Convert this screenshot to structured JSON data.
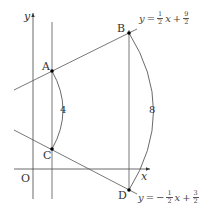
{
  "diagram": {
    "axes": {
      "x_label": "x",
      "y_label": "y",
      "origin_label": "O"
    },
    "points": [
      {
        "id": "A",
        "label": "A"
      },
      {
        "id": "B",
        "label": "B"
      },
      {
        "id": "C",
        "label": "C"
      },
      {
        "id": "D",
        "label": "D"
      }
    ],
    "segment_lengths": {
      "AC": "4",
      "BD": "8"
    },
    "lines": {
      "upper": {
        "lhs": "y",
        "eq": "=",
        "sign": "",
        "coef_num": "1",
        "coef_den": "2",
        "var": "x",
        "plus": "+",
        "const_num": "9",
        "const_den": "2"
      },
      "lower": {
        "lhs": "y",
        "eq": "=",
        "sign": "−",
        "coef_num": "1",
        "coef_den": "2",
        "var": "x",
        "plus": "+",
        "const_num": "3",
        "const_den": "2"
      }
    },
    "colors": {
      "line": "#444444",
      "point": "#000000"
    }
  }
}
